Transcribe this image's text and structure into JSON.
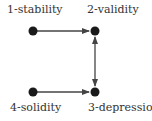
{
  "diagram": {
    "nodes": [
      {
        "id": "1",
        "label": "1-stability",
        "x": 33,
        "y": 31
      },
      {
        "id": "2",
        "label": "2-validity",
        "x": 95,
        "y": 31
      },
      {
        "id": "3",
        "label": "3-depression",
        "x": 95,
        "y": 92
      },
      {
        "id": "4",
        "label": "4-solidity",
        "x": 33,
        "y": 92
      }
    ],
    "edges": [
      {
        "from": "1",
        "to": "2",
        "type": "directed"
      },
      {
        "from": "4",
        "to": "3",
        "type": "directed"
      },
      {
        "from": "2",
        "to": "3",
        "type": "bidirected"
      }
    ],
    "colors": {
      "node": "#1a1a1a",
      "edge": "#444444",
      "text": "#333333"
    }
  }
}
